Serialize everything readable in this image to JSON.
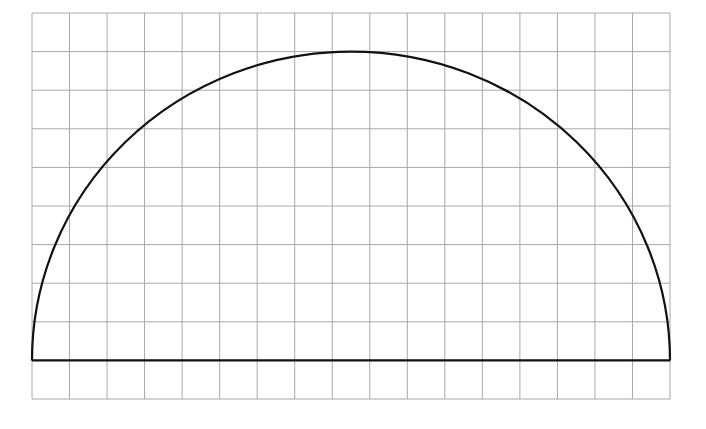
{
  "diagram": {
    "type": "semicircle-on-grid",
    "grid": {
      "columns": 17,
      "rows": 10,
      "left": 32,
      "top": 13,
      "right": 670,
      "bottom": 399,
      "line_color": "#a8a8a8",
      "line_width": 1
    },
    "semicircle": {
      "baseline_row": 9,
      "left_col": 0,
      "right_col": 17,
      "top_row": 1,
      "stroke_color": "#111111",
      "stroke_width": 2.2
    },
    "background": "#ffffff"
  }
}
